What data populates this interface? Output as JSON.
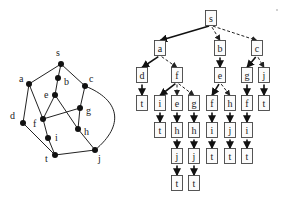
{
  "graph": {
    "nodes": [
      {
        "id": "s",
        "x": 61,
        "y": 64,
        "lx": 56,
        "ly": 56
      },
      {
        "id": "a",
        "x": 29,
        "y": 84,
        "lx": 19,
        "ly": 82
      },
      {
        "id": "b",
        "x": 58,
        "y": 78,
        "lx": 64,
        "ly": 85
      },
      {
        "id": "c",
        "x": 85,
        "y": 86,
        "lx": 89,
        "ly": 82
      },
      {
        "id": "e",
        "x": 55,
        "y": 95,
        "lx": 44,
        "ly": 98
      },
      {
        "id": "g",
        "x": 80,
        "y": 108,
        "lx": 86,
        "ly": 114
      },
      {
        "id": "d",
        "x": 23,
        "y": 123,
        "lx": 10,
        "ly": 119
      },
      {
        "id": "f",
        "x": 43,
        "y": 119,
        "lx": 33,
        "ly": 127
      },
      {
        "id": "h",
        "x": 78,
        "y": 129,
        "lx": 84,
        "ly": 135
      },
      {
        "id": "i",
        "x": 48,
        "y": 138,
        "lx": 55,
        "ly": 141
      },
      {
        "id": "t",
        "x": 55,
        "y": 155,
        "lx": 45,
        "ly": 162
      },
      {
        "id": "j",
        "x": 95,
        "y": 150,
        "lx": 98,
        "ly": 162
      }
    ],
    "edges": [
      [
        "s",
        "a"
      ],
      [
        "s",
        "b"
      ],
      [
        "s",
        "c"
      ],
      [
        "a",
        "d"
      ],
      [
        "a",
        "f"
      ],
      [
        "b",
        "e"
      ],
      [
        "e",
        "f"
      ],
      [
        "e",
        "h"
      ],
      [
        "f",
        "g"
      ],
      [
        "c",
        "g"
      ],
      [
        "g",
        "h"
      ],
      [
        "f",
        "i"
      ],
      [
        "i",
        "t"
      ],
      [
        "d",
        "t"
      ],
      [
        "h",
        "j"
      ],
      [
        "t",
        "j"
      ]
    ],
    "curved_edge": {
      "from": "c",
      "to": "j",
      "path": "M85,86 C120,100 125,125 95,150"
    }
  },
  "tree": {
    "nodes": [
      {
        "id": "n0",
        "label": "s",
        "x": 211,
        "y": 18
      },
      {
        "id": "n1",
        "label": "a",
        "x": 160,
        "y": 48
      },
      {
        "id": "n2",
        "label": "b",
        "x": 220,
        "y": 48
      },
      {
        "id": "n3",
        "label": "c",
        "x": 257,
        "y": 48
      },
      {
        "id": "n4",
        "label": "d",
        "x": 142,
        "y": 75
      },
      {
        "id": "n5",
        "label": "f",
        "x": 177,
        "y": 75
      },
      {
        "id": "n6",
        "label": "e",
        "x": 220,
        "y": 75
      },
      {
        "id": "n7",
        "label": "g",
        "x": 247,
        "y": 75
      },
      {
        "id": "n8",
        "label": "j",
        "x": 264,
        "y": 75
      },
      {
        "id": "n9",
        "label": "t",
        "x": 142,
        "y": 103
      },
      {
        "id": "n10",
        "label": "i",
        "x": 160,
        "y": 103
      },
      {
        "id": "n11",
        "label": "e",
        "x": 177,
        "y": 103
      },
      {
        "id": "n12",
        "label": "g",
        "x": 194,
        "y": 103
      },
      {
        "id": "n13",
        "label": "f",
        "x": 212,
        "y": 103
      },
      {
        "id": "n14",
        "label": "h",
        "x": 230,
        "y": 103
      },
      {
        "id": "n15",
        "label": "f",
        "x": 247,
        "y": 103
      },
      {
        "id": "n16",
        "label": "t",
        "x": 264,
        "y": 103
      },
      {
        "id": "n17",
        "label": "t",
        "x": 160,
        "y": 130
      },
      {
        "id": "n18",
        "label": "h",
        "x": 177,
        "y": 130
      },
      {
        "id": "n19",
        "label": "h",
        "x": 194,
        "y": 130
      },
      {
        "id": "n20",
        "label": "i",
        "x": 212,
        "y": 130
      },
      {
        "id": "n21",
        "label": "j",
        "x": 230,
        "y": 130
      },
      {
        "id": "n22",
        "label": "i",
        "x": 247,
        "y": 130
      },
      {
        "id": "n23",
        "label": "j",
        "x": 177,
        "y": 156
      },
      {
        "id": "n24",
        "label": "j",
        "x": 194,
        "y": 156
      },
      {
        "id": "n25",
        "label": "t",
        "x": 212,
        "y": 156
      },
      {
        "id": "n26",
        "label": "t",
        "x": 230,
        "y": 156
      },
      {
        "id": "n27",
        "label": "t",
        "x": 247,
        "y": 156
      },
      {
        "id": "n28",
        "label": "t",
        "x": 177,
        "y": 183
      },
      {
        "id": "n29",
        "label": "t",
        "x": 194,
        "y": 183
      }
    ],
    "edges": [
      {
        "from": "n0",
        "to": "n1",
        "style": "solid"
      },
      {
        "from": "n0",
        "to": "n2",
        "style": "dashed"
      },
      {
        "from": "n0",
        "to": "n3",
        "style": "dashed"
      },
      {
        "from": "n1",
        "to": "n4",
        "style": "solid"
      },
      {
        "from": "n1",
        "to": "n5",
        "style": "dashed"
      },
      {
        "from": "n2",
        "to": "n6",
        "style": "solid"
      },
      {
        "from": "n3",
        "to": "n7",
        "style": "solid"
      },
      {
        "from": "n3",
        "to": "n8",
        "style": "dashed"
      },
      {
        "from": "n4",
        "to": "n9",
        "style": "solid"
      },
      {
        "from": "n5",
        "to": "n10",
        "style": "solid"
      },
      {
        "from": "n5",
        "to": "n11",
        "style": "dashed"
      },
      {
        "from": "n5",
        "to": "n12",
        "style": "dashed"
      },
      {
        "from": "n6",
        "to": "n13",
        "style": "solid"
      },
      {
        "from": "n6",
        "to": "n14",
        "style": "dashed"
      },
      {
        "from": "n7",
        "to": "n15",
        "style": "solid"
      },
      {
        "from": "n8",
        "to": "n16",
        "style": "solid"
      },
      {
        "from": "n10",
        "to": "n17",
        "style": "solid"
      },
      {
        "from": "n11",
        "to": "n18",
        "style": "solid"
      },
      {
        "from": "n12",
        "to": "n19",
        "style": "solid"
      },
      {
        "from": "n13",
        "to": "n20",
        "style": "solid"
      },
      {
        "from": "n14",
        "to": "n21",
        "style": "solid"
      },
      {
        "from": "n15",
        "to": "n22",
        "style": "solid"
      },
      {
        "from": "n18",
        "to": "n23",
        "style": "solid"
      },
      {
        "from": "n19",
        "to": "n24",
        "style": "solid"
      },
      {
        "from": "n20",
        "to": "n25",
        "style": "solid"
      },
      {
        "from": "n21",
        "to": "n26",
        "style": "solid"
      },
      {
        "from": "n22",
        "to": "n27",
        "style": "solid"
      },
      {
        "from": "n23",
        "to": "n28",
        "style": "solid"
      },
      {
        "from": "n24",
        "to": "n29",
        "style": "solid"
      }
    ]
  },
  "box": {
    "w": 11,
    "h": 15
  }
}
